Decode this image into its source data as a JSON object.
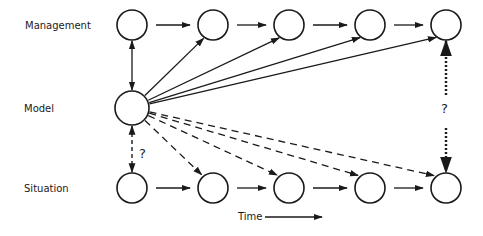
{
  "rows": [
    {
      "key": "management",
      "label": "Management",
      "nodes": 5
    },
    {
      "key": "model",
      "label": "Model",
      "nodes": 1
    },
    {
      "key": "situation",
      "label": "Situation",
      "nodes": 5
    }
  ],
  "links": {
    "management_sequence": "solid arrows left to right between consecutive management nodes",
    "situation_sequence": "solid arrows left to right between consecutive situation nodes",
    "model_to_management": {
      "style": "solid",
      "targets": [
        1,
        2,
        3,
        4
      ],
      "plus_vertical": "bidirectional solid to management node 0"
    },
    "model_to_situation": {
      "style": "dashed",
      "targets": [
        1,
        2,
        3,
        4
      ],
      "plus_vertical": "bidirectional dashed to situation node 0"
    },
    "final_management_situation": {
      "style": "dotted",
      "bidirectional": true
    }
  },
  "question_marks": [
    "?",
    "?"
  ],
  "time_axis": {
    "label": "Time"
  }
}
